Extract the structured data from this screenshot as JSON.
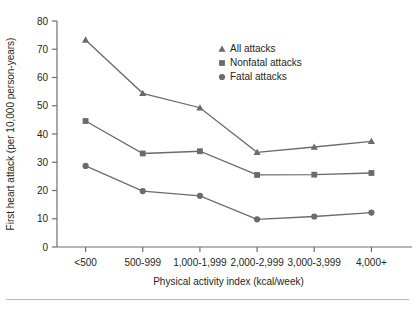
{
  "chart_data": {
    "type": "line",
    "title": "",
    "xlabel": "Physical activity index (kcal/week)",
    "ylabel": "First heart attack (per 10,000 person-years)",
    "categories": [
      "<500",
      "500-999",
      "1,000-1,999",
      "2,000-2,999",
      "3,000-3,999",
      "4,000+"
    ],
    "ylim": [
      0,
      80
    ],
    "yticks": [
      0,
      10,
      20,
      30,
      40,
      50,
      60,
      70,
      80
    ],
    "ytick_labels": [
      "0",
      "10",
      "20",
      "30",
      "40",
      "50",
      "60",
      "70",
      "80"
    ],
    "grid": false,
    "legend_position": "upper-center-right",
    "series": [
      {
        "name": "All attacks",
        "marker": "triangle",
        "color": "#6b6b6b",
        "values": [
          73.3,
          54.4,
          49.3,
          33.5,
          35.4,
          37.4
        ]
      },
      {
        "name": "Nonfatal attacks",
        "marker": "square",
        "color": "#6b6b6b",
        "values": [
          44.6,
          33.1,
          33.9,
          25.5,
          25.6,
          26.2
        ]
      },
      {
        "name": "Fatal attacks",
        "marker": "circle",
        "color": "#6b6b6b",
        "values": [
          28.7,
          19.8,
          18.1,
          9.8,
          10.8,
          12.2
        ]
      }
    ]
  },
  "legend": {
    "items": [
      {
        "label": "All attacks",
        "marker": "triangle"
      },
      {
        "label": "Nonfatal attacks",
        "marker": "square"
      },
      {
        "label": "Fatal attacks",
        "marker": "circle"
      }
    ]
  }
}
